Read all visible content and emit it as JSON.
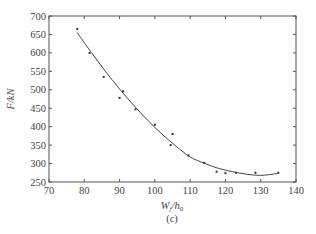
{
  "chart_data": {
    "type": "scatter",
    "title": "",
    "subtitle": "(c)",
    "xlabel": "W_j/h_0",
    "xlabel_main": "W",
    "xlabel_sub1": "j",
    "xlabel_mid": "/h",
    "xlabel_sub2": "0",
    "ylabel": "F/kN",
    "xlim": [
      70,
      140
    ],
    "ylim": [
      250,
      700
    ],
    "xticks": [
      70,
      80,
      90,
      100,
      110,
      120,
      130,
      140
    ],
    "yticks": [
      250,
      300,
      350,
      400,
      450,
      500,
      550,
      600,
      650,
      700
    ],
    "grid": false,
    "legend": null,
    "series": [
      {
        "name": "measured",
        "kind": "points",
        "x": [
          78,
          81.5,
          85.5,
          90,
          91,
          94.5,
          100,
          104.5,
          105,
          109.5,
          114,
          117.5,
          120,
          123,
          128.5,
          135
        ],
        "y": [
          665,
          600,
          535,
          478,
          496,
          447,
          405,
          350,
          380,
          322,
          302,
          278,
          274,
          275,
          275,
          275
        ]
      },
      {
        "name": "fit",
        "kind": "curve",
        "x": [
          78,
          82,
          86,
          90,
          94,
          98,
          102,
          106,
          110,
          114,
          118,
          122,
          126,
          130,
          134,
          135
        ],
        "y": [
          655,
          601,
          550,
          502,
          458,
          417,
          380,
          347,
          318,
          301,
          287,
          278,
          271,
          268,
          272,
          274
        ]
      }
    ]
  }
}
